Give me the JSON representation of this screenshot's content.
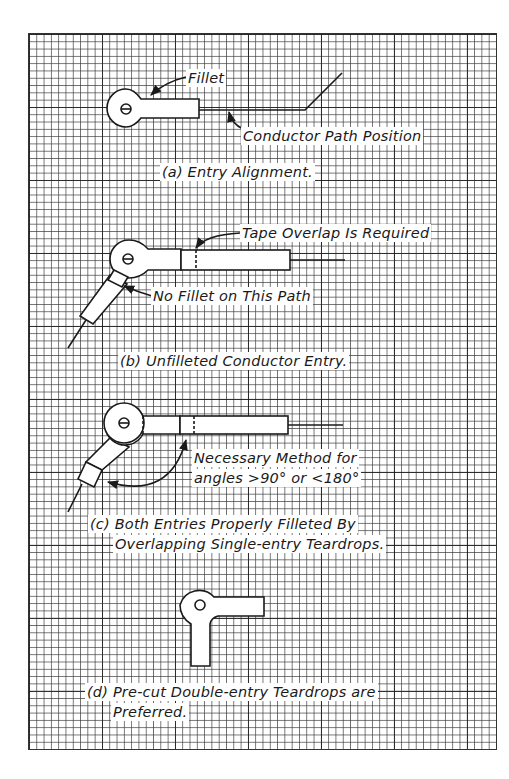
{
  "figure": {
    "background": "graph-paper grid",
    "colors": {
      "ink": "#1a1a1a",
      "paper": "#ffffff",
      "grid": "#3c3c3c"
    }
  },
  "panels": [
    {
      "id": "a",
      "caption": "(a) Entry Alignment.",
      "callouts": [
        "Fillet",
        "Conductor Path Position"
      ]
    },
    {
      "id": "b",
      "caption": "(b) Unfilleted Conductor Entry.",
      "callouts": [
        "Tape Overlap Is Required",
        "No Fillet on This Path"
      ]
    },
    {
      "id": "c",
      "caption_lines": [
        "(c) Both Entries Properly Filleted By",
        "Overlapping Single-entry Teardrops."
      ],
      "callouts": [
        "Necessary Method for",
        "angles >90° or <180°"
      ]
    },
    {
      "id": "d",
      "caption_lines": [
        "(d) Pre-cut Double-entry Teardrops are",
        "Preferred."
      ],
      "callouts": []
    }
  ]
}
